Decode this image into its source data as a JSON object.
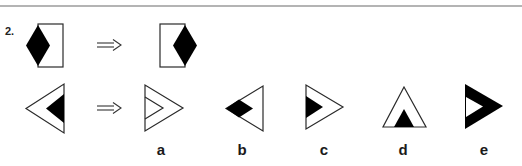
{
  "question": {
    "number": "2.",
    "example_row": {
      "premise": "rectangle-with-black-diamond-on-left-edge",
      "arrow": "implies-arrow",
      "result": "rectangle-with-black-diamond-on-right-edge"
    },
    "test_row": {
      "premise": "left-pointing-triangle-with-black-inner-triangle",
      "arrow": "implies-arrow"
    },
    "options": [
      {
        "label": "a",
        "figure": "right-pointing-triangle-with-outlined-inner-triangle"
      },
      {
        "label": "b",
        "figure": "left-pointing-triangle-with-black-diamond"
      },
      {
        "label": "c",
        "figure": "right-pointing-triangle-with-black-inner-triangle"
      },
      {
        "label": "d",
        "figure": "upward-triangle-with-black-inner-triangle"
      },
      {
        "label": "e",
        "figure": "black-right-pointing-triangle-with-white-inner-triangle"
      }
    ]
  },
  "colors": {
    "fill": "#000000",
    "stroke": "#2a2a2a",
    "rule": "#b4b4b4",
    "background": "#ffffff"
  }
}
